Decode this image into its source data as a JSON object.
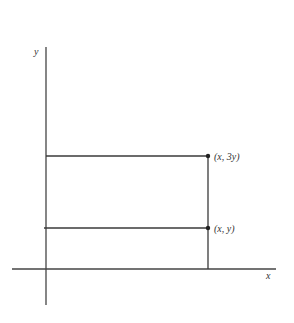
{
  "diagram": {
    "axes": {
      "x_label": "x",
      "y_label": "y",
      "color": "#444444"
    },
    "points": [
      {
        "label": "(x, 3y)",
        "px": 208,
        "py": 156
      },
      {
        "label": "(x, y)",
        "px": 208,
        "py": 228
      }
    ],
    "colors": {
      "line": "#3a3a3a",
      "text": "#333333",
      "background": "#ffffff"
    }
  }
}
